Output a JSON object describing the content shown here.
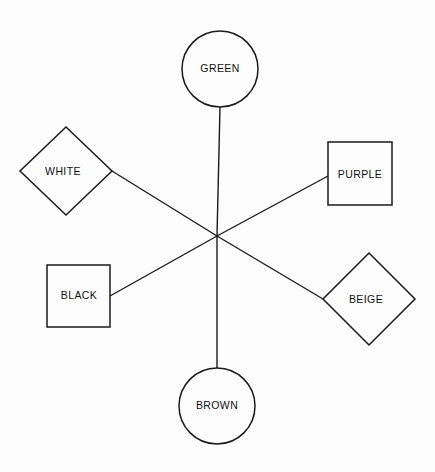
{
  "diagram": {
    "background_color": "#fdfdfd",
    "line_color": "#1a1a1a",
    "text_color": "#101010",
    "hub": {
      "x": 217,
      "y": 236
    },
    "nodes": [
      {
        "id": "green",
        "label": "GREEN",
        "shape": "circle",
        "cx": 220,
        "cy": 69,
        "r": 38,
        "label_x": 220,
        "label_y": 69,
        "connect_x": 220,
        "connect_y": 107
      },
      {
        "id": "white",
        "label": "WHITE",
        "shape": "diamond",
        "cx": 66,
        "cy": 171,
        "rx": 46,
        "ry": 44,
        "label_x": 63,
        "label_y": 172,
        "connect_x": 112,
        "connect_y": 171
      },
      {
        "id": "purple",
        "label": "PURPLE",
        "shape": "rect",
        "x": 328,
        "y": 142,
        "w": 64,
        "h": 63,
        "label_x": 360,
        "label_y": 175,
        "connect_x": 328,
        "connect_y": 176
      },
      {
        "id": "black",
        "label": "BLACK",
        "shape": "rect",
        "x": 47,
        "y": 265,
        "w": 63,
        "h": 62,
        "label_x": 79,
        "label_y": 296,
        "connect_x": 110,
        "connect_y": 296
      },
      {
        "id": "beige",
        "label": "BEIGE",
        "shape": "diamond",
        "cx": 369,
        "cy": 299,
        "rx": 46,
        "ry": 46,
        "label_x": 366,
        "label_y": 300,
        "connect_x": 323,
        "connect_y": 299
      },
      {
        "id": "brown",
        "label": "BROWN",
        "shape": "circle",
        "cx": 217,
        "cy": 406,
        "r": 38,
        "label_x": 217,
        "label_y": 406,
        "connect_x": 217,
        "connect_y": 368
      }
    ],
    "edges": [
      {
        "id": "edge-hub-green",
        "from": "hub",
        "to": "green"
      },
      {
        "id": "edge-hub-white",
        "from": "hub",
        "to": "white"
      },
      {
        "id": "edge-hub-purple",
        "from": "hub",
        "to": "purple"
      },
      {
        "id": "edge-hub-black",
        "from": "hub",
        "to": "black"
      },
      {
        "id": "edge-hub-beige",
        "from": "hub",
        "to": "beige"
      },
      {
        "id": "edge-hub-brown",
        "from": "hub",
        "to": "brown"
      }
    ]
  }
}
